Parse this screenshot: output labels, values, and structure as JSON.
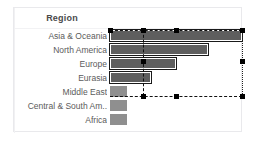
{
  "header": {
    "title": "Region"
  },
  "chart_data": {
    "type": "bar",
    "orientation": "horizontal",
    "title": "Region",
    "xlabel": "",
    "ylabel": "Region",
    "grid": false,
    "legend": "none",
    "categories": [
      "Asia & Oceania",
      "North America",
      "Europe",
      "Eurasia",
      "Middle East",
      "Central & South Am..",
      "Africa"
    ],
    "values": [
      100,
      74,
      50,
      31,
      13,
      13,
      13
    ],
    "xlim": [
      0,
      100
    ],
    "bar_color": "#8f8f8f",
    "selected_bar_color": "#5e5e5e",
    "selected_categories": [
      "Asia & Oceania",
      "North America",
      "Europe",
      "Eurasia"
    ]
  },
  "rows": [
    {
      "label": "Asia & Oceania",
      "width_px": 132,
      "selected": true
    },
    {
      "label": "North America",
      "width_px": 98,
      "selected": true
    },
    {
      "label": "Europe",
      "width_px": 66,
      "selected": true
    },
    {
      "label": "Eurasia",
      "width_px": 41,
      "selected": true
    },
    {
      "label": "Middle East",
      "width_px": 17,
      "selected": false
    },
    {
      "label": "Central & South Am..",
      "width_px": 17,
      "selected": false
    },
    {
      "label": "Africa",
      "width_px": 17,
      "selected": false
    }
  ],
  "selection": {
    "kind": "marquee-selection",
    "handle_color": "#000000",
    "line_color": "#111111"
  }
}
